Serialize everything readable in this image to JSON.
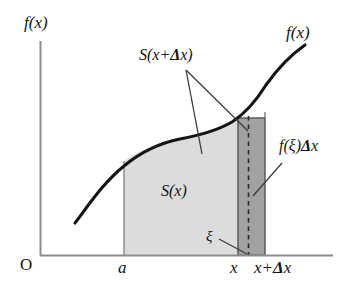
{
  "figure": {
    "axes": {
      "origin_label": "O",
      "y_axis_label": "f(x)",
      "x_ticks": [
        {
          "name": "a",
          "label": "a"
        },
        {
          "name": "x",
          "label": "x"
        },
        {
          "name": "x-plus-delta-x",
          "label_pre": "x+",
          "label_delta": "Δ",
          "label_post": "x"
        }
      ]
    },
    "curve": {
      "label": "f(x)",
      "name": "function-curve"
    },
    "regions": {
      "light": {
        "label": "S(x)",
        "name": "area-s-x",
        "fill": "#d9d9d9",
        "from_tick": "a",
        "to_tick": "x"
      },
      "dark": {
        "label_pre": "f(ξ)",
        "label_delta": "Δ",
        "label_post": "x",
        "name": "area-f-xi-delta-x",
        "fill": "#9e9e9e",
        "from_tick": "x",
        "to_tick": "x+Δx"
      }
    },
    "annotations": {
      "total_area": {
        "label_pre": "S(x+",
        "label_delta": "Δ",
        "label_post": "x)",
        "name": "label-s-x-plus-delta-x"
      },
      "xi": {
        "label": "ξ",
        "name": "label-xi"
      }
    },
    "colors": {
      "stroke": "#1a1a1a",
      "axis": "#808080",
      "light_fill": "#d9d9d9",
      "dark_fill": "#9e9e9e",
      "leader": "#4d4d4d"
    }
  }
}
